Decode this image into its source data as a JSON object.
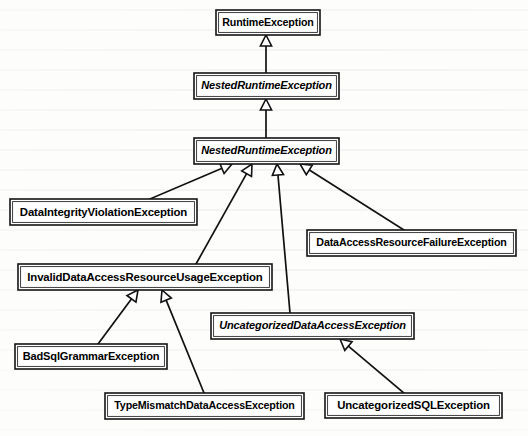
{
  "diagram": {
    "type": "uml-class-hierarchy",
    "notation": "generalization (hollow triangle arrowhead points to superclass)",
    "colors": {
      "page_background": "#fdfdfc",
      "box_fill": "#ffffff",
      "line": "#111111",
      "text": "#000000"
    },
    "nodes": [
      {
        "id": "runtime-exception",
        "label": "RuntimeException",
        "abstract": false,
        "x": 216,
        "y": 10,
        "w": 104,
        "h": 25
      },
      {
        "id": "nested-runtime-exception",
        "label": "NestedRuntimeException",
        "abstract": true,
        "x": 194,
        "y": 73,
        "w": 145,
        "h": 26
      },
      {
        "id": "nested-runtime-exception-2",
        "label": "NestedRuntimeException",
        "abstract": true,
        "x": 194,
        "y": 138,
        "w": 145,
        "h": 26
      },
      {
        "id": "data-integrity-violation-exception",
        "label": "DataIntegrityViolationException",
        "abstract": false,
        "x": 10,
        "y": 199,
        "w": 187,
        "h": 26
      },
      {
        "id": "data-access-resource-failure-exception",
        "label": "DataAccessResourceFailureException",
        "abstract": false,
        "x": 307,
        "y": 230,
        "w": 209,
        "h": 26
      },
      {
        "id": "invalid-data-access-resource-usage-exception",
        "label": "InvalidDataAccessResourceUsageException",
        "abstract": false,
        "x": 18,
        "y": 264,
        "w": 254,
        "h": 26
      },
      {
        "id": "uncategorized-data-access-exception",
        "label": "UncategorizedDataAccessException",
        "abstract": true,
        "x": 211,
        "y": 313,
        "w": 203,
        "h": 26
      },
      {
        "id": "bad-sql-grammar-exception",
        "label": "BadSqlGrammarException",
        "abstract": false,
        "x": 15,
        "y": 344,
        "w": 152,
        "h": 25
      },
      {
        "id": "type-mismatch-data-access-exception",
        "label": "TypeMismatchDataAccessException",
        "abstract": false,
        "x": 105,
        "y": 393,
        "w": 199,
        "h": 26
      },
      {
        "id": "uncategorized-sql-exception",
        "label": "UncategorizedSQLException",
        "abstract": false,
        "x": 325,
        "y": 393,
        "w": 177,
        "h": 25
      }
    ],
    "edges": [
      {
        "id": "edge-nre-to-runtimeexception",
        "from": "nested-runtime-exception",
        "to": "runtime-exception",
        "points": [
          [
            266,
            73
          ],
          [
            266,
            35
          ]
        ]
      },
      {
        "id": "edge-nre2-to-nre",
        "from": "nested-runtime-exception-2",
        "to": "nested-runtime-exception",
        "points": [
          [
            266,
            138
          ],
          [
            266,
            99
          ]
        ]
      },
      {
        "id": "edge-divex-to-nre2",
        "from": "data-integrity-violation-exception",
        "to": "nested-runtime-exception-2",
        "points": [
          [
            150,
            199
          ],
          [
            232,
            164
          ]
        ]
      },
      {
        "id": "edge-idarue-to-nre2",
        "from": "invalid-data-access-resource-usage-exception",
        "to": "nested-runtime-exception-2",
        "points": [
          [
            196,
            264
          ],
          [
            252,
            164
          ]
        ]
      },
      {
        "id": "edge-udae-to-nre2",
        "from": "uncategorized-data-access-exception",
        "to": "nested-runtime-exception-2",
        "points": [
          [
            290,
            313
          ],
          [
            277,
            164
          ]
        ]
      },
      {
        "id": "edge-darfe-to-nre2",
        "from": "data-access-resource-failure-exception",
        "to": "nested-runtime-exception-2",
        "points": [
          [
            404,
            230
          ],
          [
            300,
            164
          ]
        ]
      },
      {
        "id": "edge-bsge-to-idarue",
        "from": "bad-sql-grammar-exception",
        "to": "invalid-data-access-resource-usage-exception",
        "points": [
          [
            98,
            344
          ],
          [
            138,
            290
          ]
        ]
      },
      {
        "id": "edge-tmdae-to-idarue",
        "from": "type-mismatch-data-access-exception",
        "to": "invalid-data-access-resource-usage-exception",
        "points": [
          [
            204,
            393
          ],
          [
            162,
            290
          ]
        ]
      },
      {
        "id": "edge-usqle-to-udae",
        "from": "uncategorized-sql-exception",
        "to": "uncategorized-data-access-exception",
        "points": [
          [
            404,
            393
          ],
          [
            340,
            339
          ]
        ]
      }
    ]
  }
}
